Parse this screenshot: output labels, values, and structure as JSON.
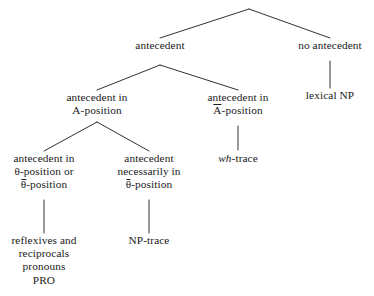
{
  "diagram": {
    "kind": "linguistic-tree",
    "colors": {
      "background": "#ffffff",
      "text": "#1a1a1a",
      "edge": "#1a1a1a"
    },
    "nodes": {
      "root": {
        "label": ""
      },
      "antecedent": {
        "lines": [
          "antecedent"
        ]
      },
      "no_antecedent": {
        "lines": [
          "no antecedent"
        ]
      },
      "antecedent_in_a_position": {
        "lines": [
          "antecedent in",
          "A-position"
        ]
      },
      "antecedent_in_abar_position": {
        "lines": [
          "antecedent in",
          "A-position"
        ],
        "bar_over": "A"
      },
      "lexical_np": {
        "lines": [
          "lexical NP"
        ]
      },
      "antecedent_theta_or_thetabar": {
        "lines": [
          "antecedent in",
          "θ-position or",
          "θ-position"
        ],
        "bar_over": "θ"
      },
      "antecedent_necessarily_thetabar": {
        "lines": [
          "antecedent",
          "necessarily in",
          "θ-position"
        ],
        "bar_over": "θ"
      },
      "wh_trace": {
        "italic_part": "wh",
        "roman_part": "-trace"
      },
      "np_trace": {
        "lines": [
          "NP-trace"
        ]
      },
      "reflexives_group": {
        "lines": [
          "reflexives and",
          "reciprocals",
          "pronouns",
          "PRO"
        ]
      }
    }
  }
}
